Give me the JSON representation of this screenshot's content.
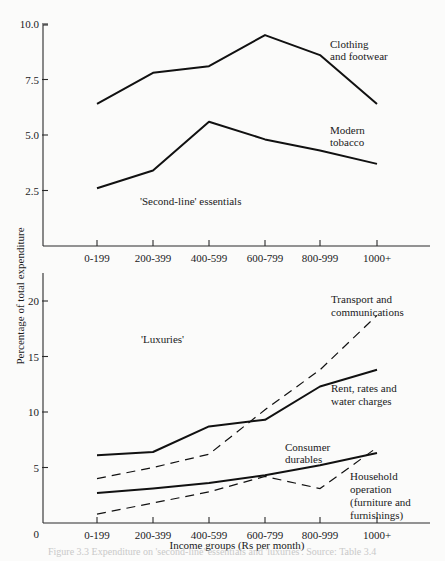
{
  "chart_data": [
    {
      "type": "line",
      "title": "",
      "group_annotation": "'Second-line' essentials",
      "xlabel": "",
      "ylabel": "Percentage of total expenditure",
      "categories": [
        "0-199",
        "200-399",
        "400-599",
        "600-799",
        "800-999",
        "1000+"
      ],
      "yticks": [
        "2.5",
        "5.0",
        "7.5",
        "10.0"
      ],
      "ylim": [
        0,
        10
      ],
      "grid": false,
      "series": [
        {
          "name": "Clothing and footwear",
          "label_lines": [
            "Clothing",
            "and footwear"
          ],
          "style": "solid",
          "values": [
            6.4,
            7.8,
            8.1,
            9.5,
            8.6,
            6.4
          ]
        },
        {
          "name": "Modern tobacco",
          "label_lines": [
            "Modern",
            "tobacco"
          ],
          "style": "solid",
          "values": [
            2.6,
            3.4,
            5.6,
            4.8,
            4.3,
            3.7
          ]
        }
      ]
    },
    {
      "type": "line",
      "title": "",
      "group_annotation": "'Luxuries'",
      "xlabel": "Income groups (Rs per month)",
      "ylabel": "Percentage of total expenditure",
      "categories": [
        "0-199",
        "200-399",
        "400-599",
        "600-799",
        "800-999",
        "1000+"
      ],
      "yticks": [
        "0",
        "5",
        "10",
        "15",
        "20"
      ],
      "ylim": [
        0,
        22
      ],
      "grid": false,
      "series": [
        {
          "name": "Transport and communications",
          "label_lines": [
            "Transport and",
            "communications"
          ],
          "style": "dashed",
          "values": [
            4.0,
            5.0,
            6.2,
            10.2,
            13.8,
            18.7
          ]
        },
        {
          "name": "Rent, rates and water charges",
          "label_lines": [
            "Rent, rates and",
            "water charges"
          ],
          "style": "solid",
          "values": [
            6.1,
            6.4,
            8.7,
            9.3,
            12.3,
            13.8
          ]
        },
        {
          "name": "Consumer durables",
          "label_lines": [
            "Consumer",
            "durables"
          ],
          "style": "solid",
          "values": [
            2.7,
            3.1,
            3.6,
            4.3,
            5.2,
            6.3
          ]
        },
        {
          "name": "Household operation (furniture and furnishings)",
          "label_lines": [
            "Household",
            "operation",
            "(furniture and",
            "furnishings)"
          ],
          "style": "dashed",
          "values": [
            0.8,
            1.8,
            2.8,
            4.2,
            3.1,
            6.8
          ]
        }
      ]
    }
  ],
  "axis_label_y": "Percentage of  total expenditure",
  "axis_label_x": "Income groups (Rs per month)",
  "caption": "Figure 3.3 Expenditure on 'second-line' essentials and 'luxuries'. Source: Table 3.4"
}
